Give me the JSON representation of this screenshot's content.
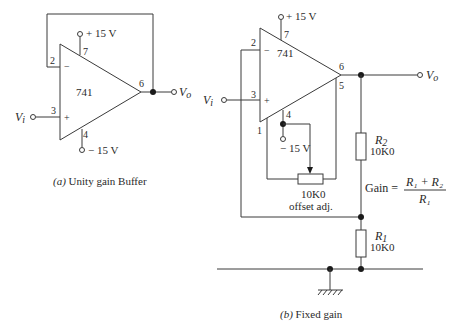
{
  "figure_a": {
    "caption_prefix": "(a)",
    "caption_text": " Unity gain Buffer",
    "opamp_label": "741",
    "pin_inverting": "2",
    "pin_noninverting": "3",
    "pin_output": "6",
    "pin_vpos": "7",
    "pin_vneg": "4",
    "sign_minus": "−",
    "sign_plus": "+",
    "supply_pos": "+ 15 V",
    "supply_neg": "− 15 V",
    "input_label": "V",
    "input_sub": "i",
    "output_label": "V",
    "output_sub": "o"
  },
  "figure_b": {
    "caption_prefix": "(b)",
    "caption_text": " Fixed gain",
    "opamp_label": "741",
    "pin_inverting": "2",
    "pin_noninverting": "3",
    "pin_output": "6",
    "pin_vpos": "7",
    "pin_vneg": "4",
    "pin_offset1": "1",
    "pin_offset5": "5",
    "sign_minus": "−",
    "sign_plus": "+",
    "supply_pos": "+ 15 V",
    "supply_neg": "− 15 V",
    "input_label": "V",
    "input_sub": "i",
    "output_label": "V",
    "output_sub": "o",
    "r2_name": "R",
    "r2_sub": "2",
    "r2_value": "10K0",
    "r1_name": "R",
    "r1_sub": "1",
    "r1_value": "10K0",
    "pot_value": "10K0",
    "pot_label": "offset adj.",
    "gain_label": "Gain  =",
    "gain_numerator": "R₁  +  R₂",
    "gain_denominator": "R₁"
  }
}
